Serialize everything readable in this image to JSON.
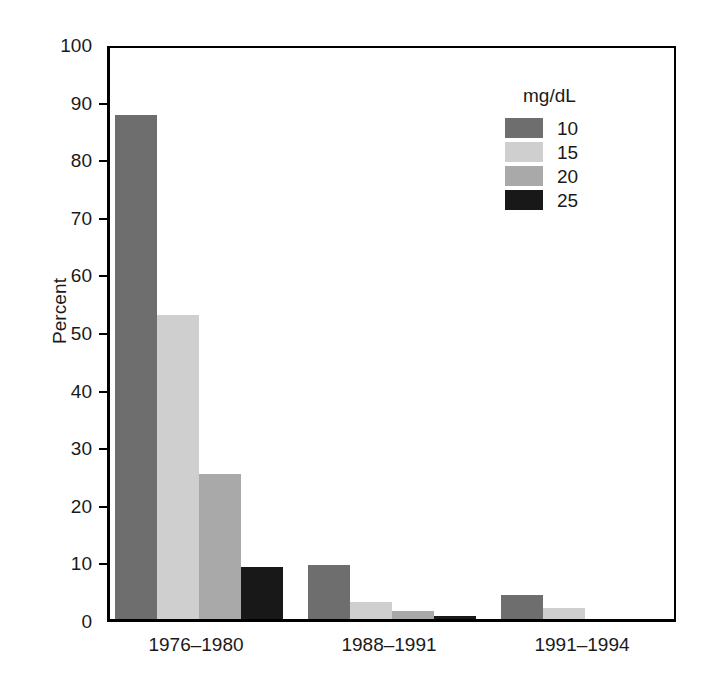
{
  "chart_data": {
    "type": "bar",
    "title": "",
    "subtitle": "",
    "xlabel": "",
    "ylabel": "Percent",
    "ylim": [
      0,
      100
    ],
    "ytick_step": 10,
    "yticks": [
      "100",
      "90",
      "80",
      "70",
      "60",
      "50",
      "40",
      "30",
      "20",
      "10",
      "0"
    ],
    "grid": false,
    "legend_position": "top-right",
    "legend_title": "mg/dL",
    "categories": [
      "1976–1980",
      "1988–1991",
      "1991–1994"
    ],
    "series": [
      {
        "name": "10",
        "color": "#6e6e6e",
        "values": [
          87.5,
          9.3,
          4.1
        ]
      },
      {
        "name": "15",
        "color": "#cfcfcf",
        "values": [
          52.8,
          3.0,
          1.9
        ]
      },
      {
        "name": "20",
        "color": "#a9a9a9",
        "values": [
          25.2,
          1.4,
          0.0
        ]
      },
      {
        "name": "25",
        "color": "#181818",
        "values": [
          9.1,
          0.5,
          0.0
        ]
      }
    ]
  },
  "axis": {
    "y_title": "Percent",
    "y_tick_labels": [
      "100",
      "90",
      "80",
      "70",
      "60",
      "50",
      "40",
      "30",
      "20",
      "10",
      "0"
    ],
    "x_tick_labels": [
      "1976–1980",
      "1988–1991",
      "1991–1994"
    ]
  },
  "legend": {
    "title": "mg/dL",
    "entries": [
      {
        "label": "10",
        "color": "#6e6e6e"
      },
      {
        "label": "15",
        "color": "#cfcfcf"
      },
      {
        "label": "20",
        "color": "#a9a9a9"
      },
      {
        "label": "25",
        "color": "#181818"
      }
    ]
  },
  "colors": {
    "axis": "#000000",
    "text": "#1a1a1a",
    "background": "#ffffff"
  }
}
